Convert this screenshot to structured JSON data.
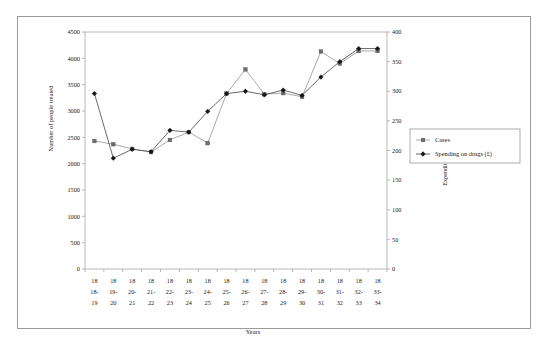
{
  "chart_data": {
    "type": "line",
    "title": "",
    "xlabel": "Years",
    "ylabel": "Number of people treated",
    "ylabel_right": "Expenditure on Drugs",
    "categories": [
      "1818-19",
      "1819-20",
      "1820-21",
      "1821-22",
      "1822-23",
      "1823-24",
      "1824-25",
      "1825-26",
      "1826-27",
      "1827-28",
      "1828-29",
      "1829-30",
      "1830-31",
      "1831-32",
      "1832-33",
      "1833-34"
    ],
    "category_lines": [
      [
        "18",
        "18-",
        "19"
      ],
      [
        "18",
        "19-",
        "20"
      ],
      [
        "18",
        "20-",
        "21"
      ],
      [
        "18",
        "21-",
        "22"
      ],
      [
        "18",
        "22-",
        "23"
      ],
      [
        "18",
        "23-",
        "24"
      ],
      [
        "18",
        "24-",
        "25"
      ],
      [
        "18",
        "25-",
        "26"
      ],
      [
        "18",
        "26-",
        "27"
      ],
      [
        "18",
        "27-",
        "28"
      ],
      [
        "18",
        "28-",
        "29"
      ],
      [
        "18",
        "29-",
        "30"
      ],
      [
        "18",
        "30-",
        "31"
      ],
      [
        "18",
        "31-",
        "32"
      ],
      [
        "18",
        "32-",
        "33"
      ],
      [
        "18",
        "33-",
        "34"
      ]
    ],
    "ylim": [
      0,
      4500
    ],
    "yticks": [
      0,
      500,
      1000,
      1500,
      2000,
      2500,
      3000,
      3500,
      4000,
      4500
    ],
    "ylim_right": [
      0,
      400
    ],
    "yticks_right": [
      0,
      50,
      100,
      150,
      200,
      250,
      300,
      350,
      400
    ],
    "grid": false,
    "legend_position": "right",
    "series": [
      {
        "name": "Cases",
        "axis": "left",
        "marker": "square",
        "color": "#6d6d6d",
        "values": [
          2430,
          2370,
          2280,
          2220,
          2450,
          2600,
          2390,
          3330,
          3790,
          3320,
          3340,
          3270,
          4130,
          3900,
          4140,
          4140
        ]
      },
      {
        "name": "Spending on drugs (£)",
        "axis": "right",
        "marker": "diamond",
        "color": "#151515",
        "values": [
          296,
          187,
          202,
          198,
          234,
          231,
          266,
          296,
          300,
          294,
          302,
          293,
          324,
          350,
          372,
          372
        ]
      }
    ],
    "legend_entries": [
      "Cases",
      "Spending on drugs (£)"
    ]
  }
}
